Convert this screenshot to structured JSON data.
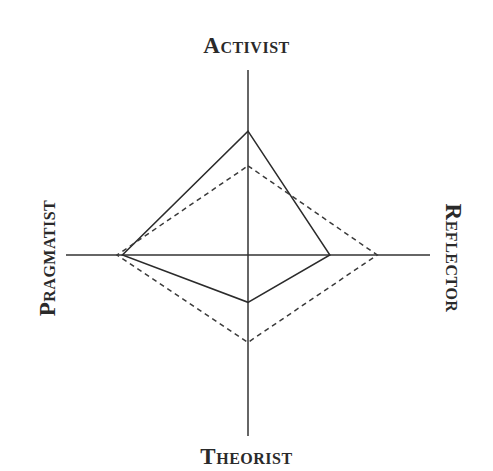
{
  "chart_data": {
    "type": "radar",
    "title": "",
    "axes": [
      "Activist",
      "Reflector",
      "Theorist",
      "Pragmatist"
    ],
    "axis_positions": {
      "Activist": "top",
      "Reflector": "right",
      "Theorist": "bottom",
      "Pragmatist": "left"
    },
    "range": [
      0,
      1
    ],
    "grid": false,
    "legend": null,
    "series": [
      {
        "name": "solid",
        "line_style": "solid",
        "values": [
          0.68,
          0.45,
          0.26,
          0.69
        ]
      },
      {
        "name": "dashed",
        "line_style": "dashed",
        "values": [
          0.49,
          0.71,
          0.48,
          0.72
        ]
      }
    ]
  },
  "labels": {
    "top": "Activist",
    "right": "Reflector",
    "bottom": "Theorist",
    "left": "Pragmatist"
  },
  "colors": {
    "axis": "#333333",
    "solid_line": "#2b2b2b",
    "dashed_line": "#3a3a3a"
  }
}
